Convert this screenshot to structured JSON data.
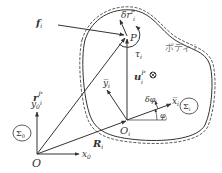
{
  "diagram": {
    "type": "rigid-body kinematics schematic",
    "colors": {
      "line": "#333333",
      "text": "#333333",
      "body_label": "#777777"
    },
    "labels": {
      "origin": "O",
      "x0": "x",
      "x0_sub": "0",
      "y0": "y",
      "y0_sub": "0",
      "sigma0": "Σ",
      "sigma0_sub": "0",
      "Ri": "R",
      "Ri_sub": "i",
      "rP": "r",
      "rP_sup": "P",
      "rP_sub": "i",
      "Oi": "O",
      "Oi_sub": "i",
      "P": "P",
      "uP": "u",
      "uP_sup": "P",
      "uP_sub": "i",
      "fi": "f",
      "fi_sub": "i",
      "drP": "δr",
      "drP_sup": "P",
      "drP_sub": "i",
      "tau": "τ",
      "tau_sub": "i",
      "ybar": "y̅",
      "ybar_sub": "i",
      "xbar": "x̅",
      "xbar_sub": "i",
      "phi": "φ",
      "phi_sub": "i",
      "dphi": "δφ",
      "dphi_sub": "i",
      "sigmai": "Σ",
      "sigmai_sub": "i",
      "body": "ボディ i",
      "center_symbol": "⊗"
    }
  }
}
